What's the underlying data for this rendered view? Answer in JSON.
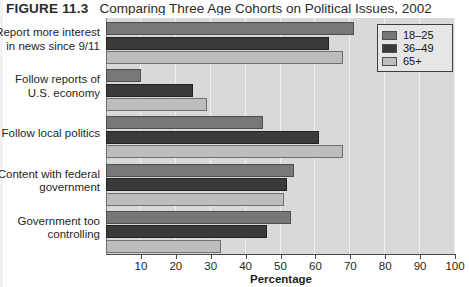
{
  "figure": {
    "number": "FIGURE 11.3",
    "title": "Comparing Three Age Cohorts on Political Issues, 2002"
  },
  "legend": {
    "position": "top-right",
    "entries": [
      {
        "label": "18–25",
        "color": "#777777"
      },
      {
        "label": "36–49",
        "color": "#3a3a3a"
      },
      {
        "label": "65+",
        "color": "#bdbdbd"
      }
    ]
  },
  "axis": {
    "x_title": "Percentage",
    "x_ticks": [
      "10",
      "20",
      "30",
      "40",
      "50",
      "60",
      "70",
      "80",
      "90",
      "100"
    ],
    "x_min": 0,
    "x_max": 100
  },
  "categories": [
    {
      "line1": "Report more interest",
      "line2": "in news since 9/11"
    },
    {
      "line1": "Follow reports of",
      "line2": "U.S. economy"
    },
    {
      "line1": "Follow local politics",
      "line2": ""
    },
    {
      "line1": "Content with federal",
      "line2": "government"
    },
    {
      "line1": "Government too",
      "line2": "controlling"
    }
  ],
  "chart_data": {
    "type": "bar",
    "orientation": "horizontal",
    "title": "Comparing Three Age Cohorts on Political Issues, 2002",
    "xlabel": "Percentage",
    "ylabel": "",
    "xlim": [
      0,
      100
    ],
    "grid": true,
    "legend_position": "top-right",
    "categories": [
      "Report more interest in news since 9/11",
      "Follow reports of U.S. economy",
      "Follow local politics",
      "Content with federal government",
      "Government too controlling"
    ],
    "series": [
      {
        "name": "18–25",
        "color": "#777777",
        "values": [
          71,
          10,
          45,
          54,
          53
        ]
      },
      {
        "name": "36–49",
        "color": "#3a3a3a",
        "values": [
          64,
          25,
          61,
          52,
          46
        ]
      },
      {
        "name": "65+",
        "color": "#bdbdbd",
        "values": [
          68,
          29,
          68,
          51,
          33
        ]
      }
    ]
  }
}
